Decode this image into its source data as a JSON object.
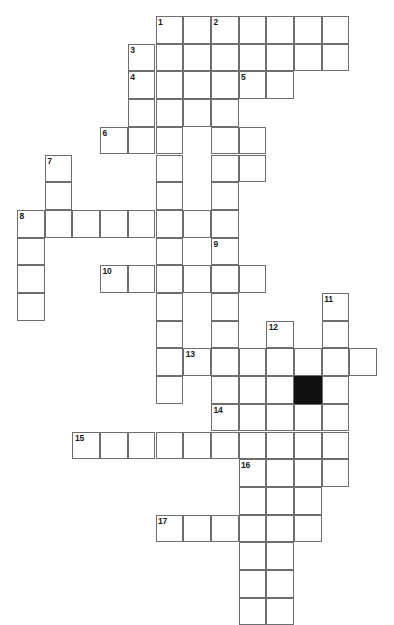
{
  "puzzle": {
    "kind": "crossword-grid",
    "title": "",
    "background_color": "#ffffff",
    "cell_fill_color": "#ffffff",
    "cell_border_color": "#6e6e6e",
    "block_color": "#111111",
    "number_color": "#1a1a1a",
    "geometry": {
      "origin_x": 17,
      "origin_y": 16,
      "cell_size": 27.7,
      "columns": 14,
      "rows": 20
    },
    "counts": {
      "total_cells": 116,
      "blocked_cells": 1,
      "numbered_clues": 17
    },
    "numbers": [
      {
        "label": "1",
        "col": 5,
        "row": 0
      },
      {
        "label": "2",
        "col": 7,
        "row": 0
      },
      {
        "label": "3",
        "col": 4,
        "row": 1
      },
      {
        "label": "4",
        "col": 4,
        "row": 2
      },
      {
        "label": "5",
        "col": 8,
        "row": 2
      },
      {
        "label": "6",
        "col": 3,
        "row": 4
      },
      {
        "label": "7",
        "col": 1,
        "row": 5
      },
      {
        "label": "8",
        "col": 0,
        "row": 7
      },
      {
        "label": "9",
        "col": 7,
        "row": 8
      },
      {
        "label": "10",
        "col": 3,
        "row": 9
      },
      {
        "label": "11",
        "col": 11,
        "row": 10
      },
      {
        "label": "12",
        "col": 9,
        "row": 11
      },
      {
        "label": "13",
        "col": 6,
        "row": 12
      },
      {
        "label": "14",
        "col": 7,
        "row": 14
      },
      {
        "label": "15",
        "col": 2,
        "row": 15
      },
      {
        "label": "16",
        "col": 8,
        "row": 16
      },
      {
        "label": "17",
        "col": 5,
        "row": 18
      }
    ],
    "blocks": [
      {
        "col": 10,
        "row": 13
      }
    ],
    "cells": [
      {
        "col": 5,
        "row": 0
      },
      {
        "col": 6,
        "row": 0
      },
      {
        "col": 7,
        "row": 0
      },
      {
        "col": 8,
        "row": 0
      },
      {
        "col": 9,
        "row": 0
      },
      {
        "col": 10,
        "row": 0
      },
      {
        "col": 11,
        "row": 0
      },
      {
        "col": 4,
        "row": 1
      },
      {
        "col": 5,
        "row": 1
      },
      {
        "col": 6,
        "row": 1
      },
      {
        "col": 7,
        "row": 1
      },
      {
        "col": 8,
        "row": 1
      },
      {
        "col": 9,
        "row": 1
      },
      {
        "col": 10,
        "row": 1
      },
      {
        "col": 11,
        "row": 1
      },
      {
        "col": 4,
        "row": 2
      },
      {
        "col": 5,
        "row": 2
      },
      {
        "col": 6,
        "row": 2
      },
      {
        "col": 7,
        "row": 2
      },
      {
        "col": 8,
        "row": 2
      },
      {
        "col": 9,
        "row": 2
      },
      {
        "col": 4,
        "row": 3
      },
      {
        "col": 5,
        "row": 3
      },
      {
        "col": 6,
        "row": 3
      },
      {
        "col": 7,
        "row": 3
      },
      {
        "col": 3,
        "row": 4
      },
      {
        "col": 4,
        "row": 4
      },
      {
        "col": 5,
        "row": 4
      },
      {
        "col": 7,
        "row": 4
      },
      {
        "col": 8,
        "row": 4
      },
      {
        "col": 1,
        "row": 5
      },
      {
        "col": 5,
        "row": 5
      },
      {
        "col": 7,
        "row": 5
      },
      {
        "col": 8,
        "row": 5
      },
      {
        "col": 1,
        "row": 6
      },
      {
        "col": 5,
        "row": 6
      },
      {
        "col": 7,
        "row": 6
      },
      {
        "col": 0,
        "row": 7
      },
      {
        "col": 1,
        "row": 7
      },
      {
        "col": 2,
        "row": 7
      },
      {
        "col": 3,
        "row": 7
      },
      {
        "col": 4,
        "row": 7
      },
      {
        "col": 5,
        "row": 7
      },
      {
        "col": 6,
        "row": 7
      },
      {
        "col": 7,
        "row": 7
      },
      {
        "col": 0,
        "row": 8
      },
      {
        "col": 5,
        "row": 8
      },
      {
        "col": 7,
        "row": 8
      },
      {
        "col": 0,
        "row": 9
      },
      {
        "col": 3,
        "row": 9
      },
      {
        "col": 4,
        "row": 9
      },
      {
        "col": 5,
        "row": 9
      },
      {
        "col": 6,
        "row": 9
      },
      {
        "col": 7,
        "row": 9
      },
      {
        "col": 8,
        "row": 9
      },
      {
        "col": 0,
        "row": 10
      },
      {
        "col": 5,
        "row": 10
      },
      {
        "col": 7,
        "row": 10
      },
      {
        "col": 11,
        "row": 10
      },
      {
        "col": 5,
        "row": 11
      },
      {
        "col": 7,
        "row": 11
      },
      {
        "col": 9,
        "row": 11
      },
      {
        "col": 11,
        "row": 11
      },
      {
        "col": 5,
        "row": 12
      },
      {
        "col": 6,
        "row": 12
      },
      {
        "col": 7,
        "row": 12
      },
      {
        "col": 8,
        "row": 12
      },
      {
        "col": 9,
        "row": 12
      },
      {
        "col": 10,
        "row": 12
      },
      {
        "col": 11,
        "row": 12
      },
      {
        "col": 12,
        "row": 12
      },
      {
        "col": 5,
        "row": 13
      },
      {
        "col": 7,
        "row": 13
      },
      {
        "col": 8,
        "row": 13
      },
      {
        "col": 9,
        "row": 13
      },
      {
        "col": 10,
        "row": 13
      },
      {
        "col": 11,
        "row": 13
      },
      {
        "col": 7,
        "row": 14
      },
      {
        "col": 8,
        "row": 14
      },
      {
        "col": 9,
        "row": 14
      },
      {
        "col": 10,
        "row": 14
      },
      {
        "col": 11,
        "row": 14
      },
      {
        "col": 2,
        "row": 15
      },
      {
        "col": 3,
        "row": 15
      },
      {
        "col": 4,
        "row": 15
      },
      {
        "col": 5,
        "row": 15
      },
      {
        "col": 6,
        "row": 15
      },
      {
        "col": 7,
        "row": 15
      },
      {
        "col": 8,
        "row": 15
      },
      {
        "col": 9,
        "row": 15
      },
      {
        "col": 10,
        "row": 15
      },
      {
        "col": 11,
        "row": 15
      },
      {
        "col": 8,
        "row": 16
      },
      {
        "col": 9,
        "row": 16
      },
      {
        "col": 10,
        "row": 16
      },
      {
        "col": 11,
        "row": 16
      },
      {
        "col": 8,
        "row": 17
      },
      {
        "col": 9,
        "row": 17
      },
      {
        "col": 10,
        "row": 17
      },
      {
        "col": 5,
        "row": 18
      },
      {
        "col": 6,
        "row": 18
      },
      {
        "col": 7,
        "row": 18
      },
      {
        "col": 8,
        "row": 18
      },
      {
        "col": 9,
        "row": 18
      },
      {
        "col": 10,
        "row": 18
      },
      {
        "col": 8,
        "row": 19
      },
      {
        "col": 9,
        "row": 19
      },
      {
        "col": 8,
        "row": 20
      },
      {
        "col": 9,
        "row": 20
      },
      {
        "col": 8,
        "row": 21
      },
      {
        "col": 9,
        "row": 21
      }
    ]
  }
}
